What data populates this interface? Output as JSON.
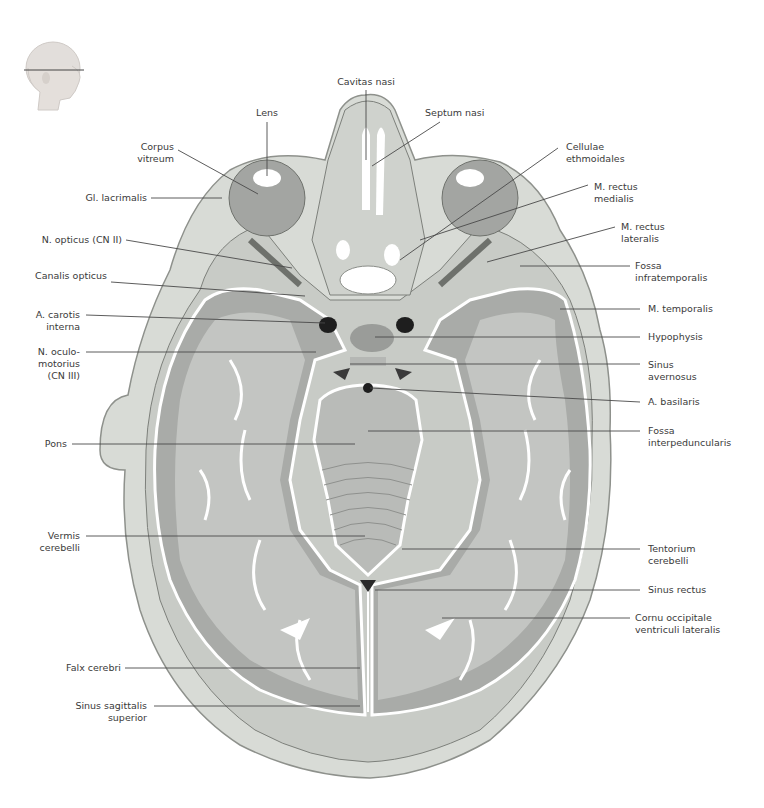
{
  "figure": {
    "orientation_icon": "head-profile-with-section-plane-icon",
    "colors": {
      "background": "#ffffff",
      "skin": "#d9dcd8",
      "bone": "#c9ccc7",
      "grey_matter": "#a7a9a6",
      "white_matter": "#c3c5c2",
      "csf": "#ffffff",
      "vessel": "#1e1e1e",
      "leader_line": "#4a4a4a",
      "label_text": "#3a3a3a"
    }
  },
  "labels": {
    "left": [
      {
        "id": "gl-lacrimalis",
        "text": "Gl. lacrimalis"
      },
      {
        "id": "corpus-vitreum",
        "text": "Corpus\nvitreum"
      },
      {
        "id": "n-opticus",
        "text": "N. opticus (CN II)"
      },
      {
        "id": "canalis-opticus",
        "text": "Canalis opticus"
      },
      {
        "id": "a-carotis-interna",
        "text": "A. carotis\ninterna"
      },
      {
        "id": "n-oculomotorius",
        "text": "N. oculo-\nmotorius\n(CN III)"
      },
      {
        "id": "pons",
        "text": "Pons"
      },
      {
        "id": "vermis-cerebelli",
        "text": "Vermis\ncerebelli"
      },
      {
        "id": "falx-cerebri",
        "text": "Falx cerebri"
      },
      {
        "id": "sinus-sagittalis-superior",
        "text": "Sinus sagittalis\nsuperior"
      }
    ],
    "top": [
      {
        "id": "lens",
        "text": "Lens"
      },
      {
        "id": "cavitas-nasi",
        "text": "Cavitas nasi"
      },
      {
        "id": "septum-nasi",
        "text": "Septum nasi"
      }
    ],
    "right": [
      {
        "id": "cellulae-ethmoidales",
        "text": "Cellulae\nethmoidales"
      },
      {
        "id": "m-rectus-medialis",
        "text": "M. rectus\nmedialis"
      },
      {
        "id": "m-rectus-lateralis",
        "text": "M. rectus\nlateralis"
      },
      {
        "id": "fossa-infratemporalis",
        "text": "Fossa\ninfratemporalis"
      },
      {
        "id": "m-temporalis",
        "text": "M. temporalis"
      },
      {
        "id": "hypophysis",
        "text": "Hypophysis"
      },
      {
        "id": "sinus-cavernosus",
        "text": "Sinus\navernosus"
      },
      {
        "id": "a-basilaris",
        "text": "A. basilaris"
      },
      {
        "id": "fossa-interpeduncularis",
        "text": "Fossa\ninterpeduncularis"
      },
      {
        "id": "tentorium-cerebelli",
        "text": "Tentorium\ncerebelli"
      },
      {
        "id": "sinus-rectus",
        "text": "Sinus rectus"
      },
      {
        "id": "cornu-occipitale",
        "text": "Cornu occipitale\nventriculi lateralis"
      }
    ]
  }
}
